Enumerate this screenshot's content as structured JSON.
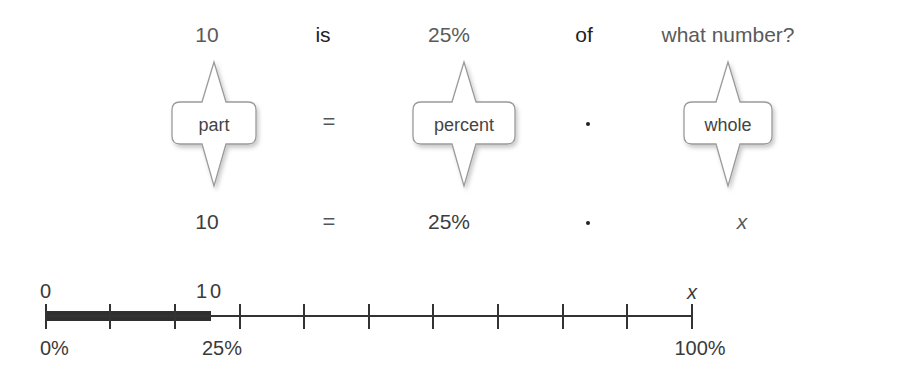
{
  "sentence": {
    "words": [
      {
        "text": "10",
        "x": 207
      },
      {
        "text": "is",
        "x": 323
      },
      {
        "text": "25%",
        "x": 449
      },
      {
        "text": "of",
        "x": 584
      },
      {
        "text": "what number?",
        "x": 728
      }
    ]
  },
  "callouts": [
    {
      "label": "part",
      "x": 214
    },
    {
      "label": "percent",
      "x": 464
    },
    {
      "label": "whole",
      "x": 728
    }
  ],
  "callout_operators": [
    {
      "symbol": "=",
      "x": 329,
      "type": "equals"
    },
    {
      "symbol": "·",
      "x": 588,
      "type": "dot"
    }
  ],
  "equation": {
    "terms": [
      {
        "text": "10",
        "x": 207,
        "italic": false
      },
      {
        "text": "=",
        "x": 329,
        "type": "equals"
      },
      {
        "text": "25%",
        "x": 449,
        "italic": false
      },
      {
        "text": "·",
        "x": 588,
        "type": "dot"
      },
      {
        "text": "x",
        "x": 742,
        "italic": true
      }
    ]
  },
  "number_line": {
    "start_x": 46,
    "end_x": 692,
    "tick_count": 11,
    "shaded_fraction": 0.25,
    "top_labels": [
      {
        "text": "0",
        "position": 0
      },
      {
        "text": "10",
        "position": 0.25
      },
      {
        "text": "x",
        "position": 1.0,
        "italic": true
      }
    ],
    "bottom_labels": [
      {
        "text": "0%",
        "position": 0
      },
      {
        "text": "25%",
        "position": 0.25
      },
      {
        "text": "100%",
        "position": 1.0
      }
    ]
  },
  "colors": {
    "text": "#3d3d3d",
    "bar_fill": "#2f2f2f",
    "axis": "#333333",
    "callout_border": "#9a9a9a",
    "callout_shadow": "#c8c8c8"
  }
}
